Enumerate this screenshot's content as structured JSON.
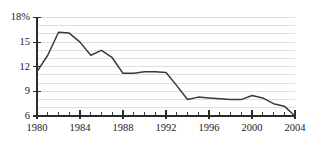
{
  "chart_data": {
    "type": "line",
    "title": "",
    "xlabel": "",
    "ylabel": "",
    "xlim": [
      1980,
      2004
    ],
    "ylim": [
      6,
      18
    ],
    "grid": true,
    "gridline_step": 1,
    "legend": "none",
    "y_ticks": [
      {
        "value": 18,
        "label": "18%"
      },
      {
        "value": 15,
        "label": "15"
      },
      {
        "value": 12,
        "label": "12"
      },
      {
        "value": 9,
        "label": "9"
      },
      {
        "value": 6,
        "label": "6"
      }
    ],
    "x_ticks": [
      {
        "value": 1980,
        "label": "1980"
      },
      {
        "value": 1984,
        "label": "1984"
      },
      {
        "value": 1988,
        "label": "1988"
      },
      {
        "value": 1992,
        "label": "1992"
      },
      {
        "value": 1996,
        "label": "1996"
      },
      {
        "value": 2000,
        "label": "2000"
      },
      {
        "value": 2004,
        "label": "2004"
      }
    ],
    "x_minor_ticks": [
      1981,
      1982,
      1983,
      1985,
      1986,
      1987,
      1989,
      1990,
      1991,
      1993,
      1994,
      1995,
      1997,
      1998,
      1999,
      2001,
      2002,
      2003
    ],
    "series": [
      {
        "name": "rate",
        "color": "#3a3a3a",
        "x": [
          1980,
          1981,
          1982,
          1983,
          1984,
          1985,
          1986,
          1987,
          1988,
          1989,
          1990,
          1991,
          1992,
          1993,
          1994,
          1995,
          1996,
          1997,
          1998,
          1999,
          2000,
          2001,
          2002,
          2003,
          2004
        ],
        "values": [
          11.4,
          13.4,
          16.2,
          16.1,
          15.0,
          13.4,
          14.0,
          13.1,
          11.2,
          11.2,
          11.4,
          11.4,
          11.3,
          9.7,
          8.0,
          8.3,
          8.2,
          8.1,
          8.0,
          8.0,
          8.5,
          8.2,
          7.5,
          7.2,
          6.0
        ]
      }
    ],
    "colors": {
      "line": "#3a3a3a",
      "grid": "#c9c9c9",
      "axis": "#2b2b2b",
      "text": "#1a1a1a",
      "background": "#ffffff"
    }
  }
}
